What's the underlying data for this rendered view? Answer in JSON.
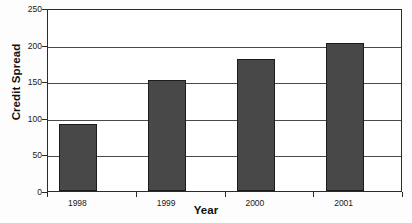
{
  "chart_data": {
    "type": "bar",
    "title": "",
    "categories": [
      "1998",
      "1999",
      "2000",
      "2001"
    ],
    "values": [
      91,
      151,
      181,
      202
    ],
    "series": [
      {
        "name": "Credit Spread",
        "values": [
          91,
          151,
          181,
          202
        ]
      }
    ],
    "xlabel": "Year",
    "ylabel": "Credit Spread",
    "ylim": [
      0,
      250
    ],
    "yticks": [
      0,
      50,
      100,
      150,
      200,
      250
    ],
    "ytick_labels": [
      "0",
      "50",
      "100",
      "150",
      "200",
      "250"
    ],
    "grid": true,
    "grid_axis": "y",
    "legend": false,
    "legend_position": "none",
    "bar_color": "#484848",
    "bar_edge_color": "#1c1c1c",
    "plot_background": "#ffffff",
    "axis_color": "#2b2b2b",
    "gridline_color": "#4a4a4a"
  }
}
